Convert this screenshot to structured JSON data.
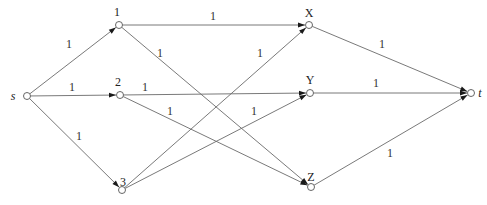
{
  "diagram": {
    "type": "flow-network",
    "nodes": [
      {
        "id": "s",
        "label": "s",
        "x": 27,
        "y": 96,
        "lx": 13,
        "ly": 100,
        "italic": true
      },
      {
        "id": "1",
        "label": "1",
        "x": 119,
        "y": 25,
        "lx": 117,
        "ly": 16,
        "italic": false
      },
      {
        "id": "2",
        "label": "2",
        "x": 120,
        "y": 95,
        "lx": 118,
        "ly": 86,
        "italic": false
      },
      {
        "id": "3",
        "label": "3",
        "x": 122,
        "y": 190,
        "lx": 123,
        "ly": 186,
        "italic": false
      },
      {
        "id": "X",
        "label": "X",
        "x": 309,
        "y": 25,
        "lx": 309,
        "ly": 17,
        "italic": false
      },
      {
        "id": "Y",
        "label": "Y",
        "x": 310,
        "y": 93,
        "lx": 310,
        "ly": 84,
        "italic": false
      },
      {
        "id": "Z",
        "label": "Z",
        "x": 311,
        "y": 187,
        "lx": 311,
        "ly": 181,
        "italic": false
      },
      {
        "id": "t",
        "label": "t",
        "x": 471,
        "y": 93,
        "lx": 480,
        "ly": 97,
        "italic": true
      }
    ],
    "edges": [
      {
        "from": "s",
        "to": "1",
        "capacity": "1",
        "lx": 69,
        "ly": 48
      },
      {
        "from": "s",
        "to": "2",
        "capacity": "1",
        "lx": 72,
        "ly": 91
      },
      {
        "from": "s",
        "to": "3",
        "capacity": "1",
        "lx": 79,
        "ly": 140
      },
      {
        "from": "1",
        "to": "X",
        "capacity": "1",
        "lx": 213,
        "ly": 20
      },
      {
        "from": "1",
        "to": "Z",
        "capacity": "1",
        "lx": 160,
        "ly": 57
      },
      {
        "from": "2",
        "to": "Y",
        "capacity": "1",
        "lx": 145,
        "ly": 91
      },
      {
        "from": "2",
        "to": "Z",
        "capacity": "1",
        "lx": 170,
        "ly": 115
      },
      {
        "from": "3",
        "to": "X",
        "capacity": "1",
        "lx": 260,
        "ly": 57
      },
      {
        "from": "3",
        "to": "Y",
        "capacity": "1",
        "lx": 254,
        "ly": 115
      },
      {
        "from": "X",
        "to": "t",
        "capacity": "1",
        "lx": 382,
        "ly": 48
      },
      {
        "from": "Y",
        "to": "t",
        "capacity": "1",
        "lx": 376,
        "ly": 87
      },
      {
        "from": "Z",
        "to": "t",
        "capacity": "1",
        "lx": 390,
        "ly": 157
      }
    ],
    "colors": {
      "edge": "#6a6a6a",
      "node_stroke": "#555555",
      "text": "#333333",
      "background": "#ffffff"
    }
  }
}
